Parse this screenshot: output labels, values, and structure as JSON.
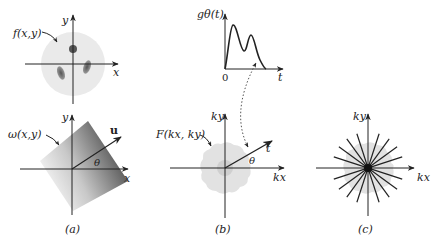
{
  "figure": {
    "panels": [
      {
        "id": "a",
        "caption": "(a)",
        "top": {
          "function_label": "f(x,y)",
          "x_axis_label": "x",
          "y_axis_label": "y",
          "description": "Phantom object: light disk with three dark blobs"
        },
        "bottom": {
          "function_label": "ω(x,y)",
          "x_axis_label": "x",
          "y_axis_label": "y",
          "vector_label": "u",
          "angle_label": "θ",
          "description": "Gradient-shaded half-plane rotated by θ along direction u"
        }
      },
      {
        "id": "b",
        "caption": "(b)",
        "top": {
          "function_label": "gθ(t)",
          "x_axis_label": "t",
          "origin_label": "0",
          "description": "Projection profile with two peaks"
        },
        "bottom": {
          "function_label": "F(kx, ky)",
          "x_axis_label": "kx",
          "y_axis_label": "ky",
          "line_label": "t",
          "angle_label": "θ",
          "description": "Fourier slice along angle θ in frequency domain"
        }
      },
      {
        "id": "c",
        "caption": "(c)",
        "x_axis_label": "kx",
        "y_axis_label": "ky",
        "spoke_count": 20,
        "description": "Radial sampling pattern in k-space"
      }
    ],
    "colors": {
      "ink": "#222222",
      "disk": "#e8e8e8",
      "blob": "#6a6a6a",
      "half_plane_dark": "#555555",
      "blob_light": "#dcdcdc",
      "blob_inner": "#c4c4c4"
    }
  }
}
